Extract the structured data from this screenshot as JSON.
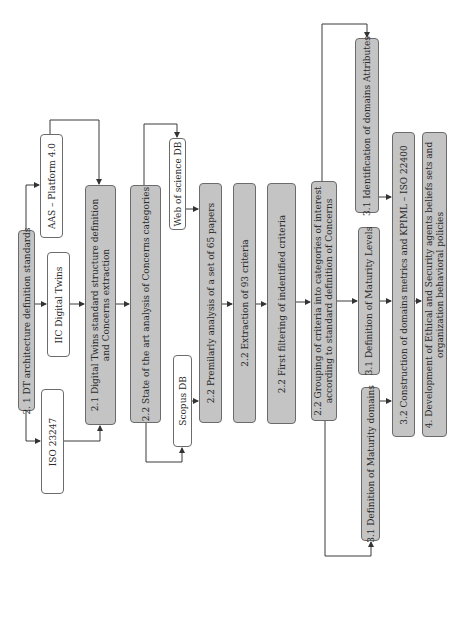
{
  "diagram": {
    "nodes": {
      "dt_arch": {
        "label": "2. 1 DT architecture definition standards",
        "fill": "grey"
      },
      "aas": {
        "label": "AAS – Platform 4.0",
        "fill": "white"
      },
      "iic": {
        "label": "IIC Digital Twins",
        "fill": "white"
      },
      "iso23247": {
        "label": "ISO 23247",
        "fill": "white"
      },
      "dt_structure": {
        "label": "2.1 Digital Twins standard structure definition and Concerns extraction",
        "fill": "grey"
      },
      "state_art": {
        "label": "2.2 State of the art analysis of Concerns categories",
        "fill": "grey"
      },
      "wos": {
        "label": "Web of science  DB",
        "fill": "white"
      },
      "scopus": {
        "label": "Scopus  DB",
        "fill": "white"
      },
      "premilarly": {
        "label": "2.2 Premilarly analysis of a set of 65 papers",
        "fill": "grey"
      },
      "extraction": {
        "label": "2.2 Extraction of 93 criteria",
        "fill": "grey"
      },
      "filtering": {
        "label": "2.2 First filtering of indentified criteria",
        "fill": "grey"
      },
      "grouping": {
        "label": "2.2 Grouping of criteria into categories of interest according to standard definition of Concerns",
        "fill": "grey"
      },
      "ident_attr": {
        "label": "3.1 Identification of domains Attributes",
        "fill": "grey"
      },
      "maturity_levels": {
        "label": "3.1 Definition of Maturity Levels",
        "fill": "grey"
      },
      "maturity_domains": {
        "label": "3.1  Definition of Maturity domains",
        "fill": "grey"
      },
      "construction": {
        "label": "3.2 Construction of domains metrics and KPIML – ISO 22400",
        "fill": "grey"
      },
      "development": {
        "label": "4. Development of Ethical and Security agents beliefs sets and organization behavioral policies",
        "fill": "grey"
      }
    },
    "edges": [
      {
        "from": "dt_arch",
        "to": "aas"
      },
      {
        "from": "dt_arch",
        "to": "iic"
      },
      {
        "from": "dt_arch",
        "to": "iso23247"
      },
      {
        "from": "aas",
        "to": "dt_structure"
      },
      {
        "from": "iic",
        "to": "dt_structure"
      },
      {
        "from": "iso23247",
        "to": "dt_structure"
      },
      {
        "from": "dt_structure",
        "to": "state_art"
      },
      {
        "from": "state_art",
        "to": "wos"
      },
      {
        "from": "state_art",
        "to": "scopus"
      },
      {
        "from": "wos",
        "to": "premilarly"
      },
      {
        "from": "scopus",
        "to": "premilarly"
      },
      {
        "from": "premilarly",
        "to": "extraction"
      },
      {
        "from": "extraction",
        "to": "filtering"
      },
      {
        "from": "filtering",
        "to": "grouping"
      },
      {
        "from": "grouping",
        "to": "ident_attr"
      },
      {
        "from": "grouping",
        "to": "maturity_levels"
      },
      {
        "from": "grouping",
        "to": "maturity_domains"
      },
      {
        "from": "ident_attr",
        "to": "construction"
      },
      {
        "from": "maturity_levels",
        "to": "construction"
      },
      {
        "from": "maturity_domains",
        "to": "construction"
      },
      {
        "from": "construction",
        "to": "development"
      }
    ],
    "colors": {
      "box_fill_grey": "#c4c4c4",
      "box_fill_white": "#ffffff",
      "stroke": "#3a3a3a"
    }
  }
}
